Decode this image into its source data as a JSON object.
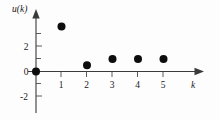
{
  "chart_data": {
    "type": "scatter",
    "title": "",
    "xlabel": "k",
    "ylabel": "u(k)",
    "x": [
      0,
      1,
      2,
      3,
      4,
      5
    ],
    "values": [
      0,
      3.6,
      0.5,
      1,
      1,
      1
    ],
    "series": [
      {
        "name": "u(k)",
        "values": [
          0,
          3.6,
          0.5,
          1,
          1,
          1
        ]
      }
    ],
    "xlim": [
      -0.35,
      6.2
    ],
    "ylim": [
      -3.0,
      4.6
    ],
    "xticks": [
      1,
      2,
      3,
      4,
      5
    ],
    "xtick_labels": [
      "1",
      "2",
      "3",
      "4",
      "5"
    ],
    "yticks": [
      -2,
      0,
      2
    ],
    "ytick_labels": [
      "-2",
      "0",
      "2"
    ],
    "yminorticks": [
      -1,
      1,
      3
    ],
    "grid": false,
    "legend": "none",
    "marker": "filled-circle",
    "marker_color": "#0d0d0d",
    "axis_color": "#3a3a3a",
    "background_color": "#fdfdfd"
  },
  "axes": {
    "y_title": "u(k)",
    "x_title": "k",
    "y_labels": [
      {
        "text": "2",
        "value": 2
      },
      {
        "text": "0",
        "value": 0
      },
      {
        "text": "-2",
        "value": -2
      }
    ],
    "x_labels": [
      {
        "text": "1",
        "value": 1
      },
      {
        "text": "2",
        "value": 2
      },
      {
        "text": "3",
        "value": 3
      },
      {
        "text": "4",
        "value": 4
      },
      {
        "text": "5",
        "value": 5
      }
    ]
  },
  "points": [
    {
      "label": "u(0)",
      "k": 0,
      "u": 0
    },
    {
      "label": "u(1)",
      "k": 1,
      "u": 3.6
    },
    {
      "label": "u(2)",
      "k": 2,
      "u": 0.5
    },
    {
      "label": "u(3)",
      "k": 3,
      "u": 1
    },
    {
      "label": "u(4)",
      "k": 4,
      "u": 1
    },
    {
      "label": "u(5)",
      "k": 5,
      "u": 1
    }
  ]
}
